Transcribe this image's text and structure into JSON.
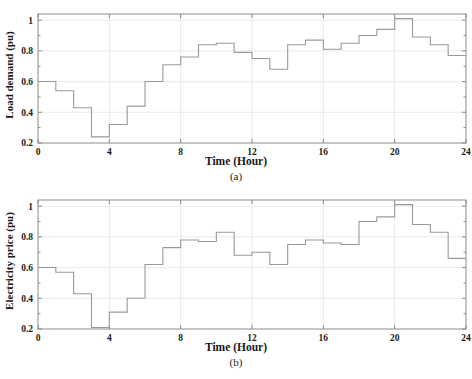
{
  "figure": {
    "background": "#ffffff",
    "line_color": "#999999",
    "axis_color": "#8c8c8c",
    "grid_color": "#dcdcdc",
    "text_color": "#1a1a1a"
  },
  "panel_a": {
    "caption": "(a)",
    "ylabel": "Load demand (pu)",
    "xlabel": "Time (Hour)"
  },
  "panel_b": {
    "caption": "(b)",
    "ylabel": "Electricity price (pu)",
    "xlabel": "Time (Hour)"
  },
  "ticks": {
    "x": [
      "0",
      "4",
      "8",
      "12",
      "16",
      "20",
      "24"
    ],
    "y": [
      "0.2",
      "0.4",
      "0.6",
      "0.8",
      "1"
    ]
  },
  "chart_data": [
    {
      "type": "line",
      "drawstyle": "steps-post",
      "title": "",
      "subtitle": "(a)",
      "xlabel": "Time (Hour)",
      "ylabel": "Load demand (pu)",
      "xlim": [
        0,
        24
      ],
      "ylim": [
        0.2,
        1.04
      ],
      "xticks": [
        0,
        4,
        8,
        12,
        16,
        20,
        24
      ],
      "yticks": [
        0.2,
        0.4,
        0.6,
        0.8,
        1
      ],
      "grid": true,
      "legend": null,
      "x": [
        0,
        1,
        2,
        3,
        4,
        5,
        6,
        7,
        8,
        9,
        10,
        11,
        12,
        13,
        14,
        15,
        16,
        17,
        18,
        19,
        20,
        21,
        22,
        23,
        24
      ],
      "values": [
        0.6,
        0.54,
        0.43,
        0.24,
        0.32,
        0.44,
        0.6,
        0.71,
        0.76,
        0.84,
        0.85,
        0.79,
        0.75,
        0.68,
        0.84,
        0.87,
        0.81,
        0.85,
        0.9,
        0.94,
        1.01,
        0.89,
        0.84,
        0.77,
        0.77
      ]
    },
    {
      "type": "line",
      "drawstyle": "steps-post",
      "title": "",
      "subtitle": "(b)",
      "xlabel": "Time (Hour)",
      "ylabel": "Electricity price (pu)",
      "xlim": [
        0,
        24
      ],
      "ylim": [
        0.2,
        1.04
      ],
      "xticks": [
        0,
        4,
        8,
        12,
        16,
        20,
        24
      ],
      "yticks": [
        0.2,
        0.4,
        0.6,
        0.8,
        1
      ],
      "grid": true,
      "legend": null,
      "x": [
        0,
        1,
        2,
        3,
        4,
        5,
        6,
        7,
        8,
        9,
        10,
        11,
        12,
        13,
        14,
        15,
        16,
        17,
        18,
        19,
        20,
        21,
        22,
        23,
        24
      ],
      "values": [
        0.6,
        0.57,
        0.43,
        0.21,
        0.31,
        0.4,
        0.62,
        0.73,
        0.78,
        0.77,
        0.83,
        0.68,
        0.7,
        0.62,
        0.75,
        0.78,
        0.76,
        0.75,
        0.9,
        0.93,
        1.01,
        0.88,
        0.83,
        0.66,
        0.66
      ]
    }
  ]
}
